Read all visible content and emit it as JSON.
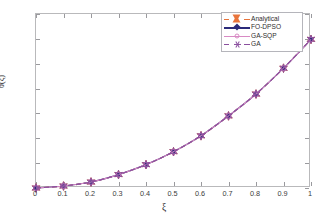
{
  "chart_data": {
    "type": "line",
    "title": "",
    "xlabel": "ξ",
    "ylabel": "θ(ξ)",
    "xlim": [
      0,
      1
    ],
    "ylim": [
      0.7,
      1.05
    ],
    "xticks": [
      "0",
      "0.1",
      "0.2",
      "0.3",
      "0.4",
      "0.5",
      "0.6",
      "0.7",
      "0.8",
      "0.9",
      "1"
    ],
    "xtick_values": [
      0,
      0.1,
      0.2,
      0.3,
      0.4,
      0.5,
      0.6,
      0.7,
      0.8,
      0.9,
      1
    ],
    "yticks": [
      "0.7",
      "0.75",
      "0.8",
      "0.85",
      "0.9",
      "0.95",
      "1",
      "1.05"
    ],
    "ytick_values": [
      0.7,
      0.75,
      0.8,
      0.85,
      0.9,
      0.95,
      1.0,
      1.05
    ],
    "grid": false,
    "legend_position": "top-right",
    "x": [
      0,
      0.1,
      0.2,
      0.3,
      0.4,
      0.5,
      0.6,
      0.7,
      0.8,
      0.9,
      1
    ],
    "series": [
      {
        "name": "Analytical",
        "color": "#e8743b",
        "marker": "hexagram-filled",
        "linestyle": "dashed",
        "values": [
          0.7,
          0.704,
          0.712,
          0.727,
          0.747,
          0.773,
          0.805,
          0.845,
          0.889,
          0.941,
          0.999
        ]
      },
      {
        "name": "FO-DPSO",
        "color": "#2b2b7a",
        "marker": "diamond-filled",
        "linestyle": "solid",
        "values": [
          0.7,
          0.704,
          0.712,
          0.727,
          0.747,
          0.773,
          0.805,
          0.845,
          0.889,
          0.941,
          0.999
        ]
      },
      {
        "name": "GA-SQP",
        "color": "#d88ac4",
        "marker": "circle-open",
        "linestyle": "solid",
        "values": [
          0.7,
          0.704,
          0.712,
          0.727,
          0.747,
          0.773,
          0.805,
          0.845,
          0.889,
          0.941,
          0.999
        ]
      },
      {
        "name": "GA",
        "color": "#8a4f9e",
        "marker": "hexagram-open",
        "linestyle": "dashed",
        "values": [
          0.7,
          0.704,
          0.712,
          0.727,
          0.747,
          0.773,
          0.805,
          0.845,
          0.889,
          0.941,
          0.999
        ]
      }
    ]
  },
  "legend": {
    "items": [
      {
        "label": "Analytical"
      },
      {
        "label": "FO-DPSO"
      },
      {
        "label": "GA-SQP"
      },
      {
        "label": "GA"
      }
    ]
  },
  "colors": {
    "axis": "#b9b9bb",
    "tick_text": "#3c3c3c",
    "curve": "#7a4f8f",
    "background": "#ffffff"
  }
}
